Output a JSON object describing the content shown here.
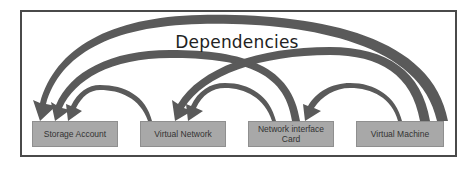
{
  "diagram": {
    "title": "Dependencies",
    "nodes": [
      {
        "id": "storage",
        "label": "Storage Account"
      },
      {
        "id": "vnet",
        "label": "Virtual Network"
      },
      {
        "id": "nic",
        "label": "Network interface Card"
      },
      {
        "id": "vm",
        "label": "Virtual Machine"
      }
    ],
    "edges": [
      {
        "from": "Virtual Machine",
        "to": "Storage Account"
      },
      {
        "from": "Network interface Card",
        "to": "Storage Account"
      },
      {
        "from": "Virtual Network",
        "to": "Storage Account"
      },
      {
        "from": "Virtual Machine",
        "to": "Virtual Network"
      },
      {
        "from": "Network interface Card",
        "to": "Virtual Network"
      },
      {
        "from": "Virtual Machine",
        "to": "Network interface Card"
      }
    ],
    "colors": {
      "node_fill": "#a8a8a8",
      "arrow": "#555555",
      "frame": "#4a4a4a"
    }
  }
}
